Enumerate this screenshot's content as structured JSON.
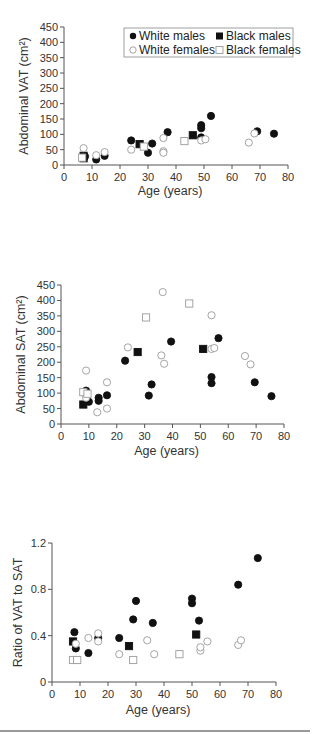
{
  "legend": {
    "white_males": "White males",
    "black_males": "Black males",
    "white_females": "White females",
    "black_females": "Black females"
  },
  "colors": {
    "filled": "#111111",
    "open_stroke": "#9a9a9a",
    "axis": "#555555"
  },
  "chart_data": [
    {
      "type": "scatter",
      "title": "",
      "xlabel": "Age (years)",
      "ylabel": "Abdominal VAT (cm²)",
      "xlim": [
        0,
        80
      ],
      "ylim": [
        0,
        450
      ],
      "xticks": [
        0,
        10,
        20,
        30,
        40,
        50,
        60,
        70,
        80
      ],
      "yticks": [
        0,
        50,
        100,
        150,
        200,
        250,
        300,
        350,
        400,
        450
      ],
      "grid": false,
      "legend_position": "upper right",
      "series": [
        {
          "name": "White males",
          "marker": "filled-circle",
          "points": [
            [
              7.5,
              28
            ],
            [
              11.5,
              18
            ],
            [
              14.5,
              30
            ],
            [
              24,
              80
            ],
            [
              30,
              40
            ],
            [
              31.5,
              70
            ],
            [
              37,
              107
            ],
            [
              49,
              90
            ],
            [
              49,
              120
            ],
            [
              49,
              130
            ],
            [
              52.5,
              160
            ],
            [
              69,
              110
            ],
            [
              75,
              102
            ]
          ]
        },
        {
          "name": "Black males",
          "marker": "filled-square",
          "points": [
            [
              7,
              22
            ],
            [
              7,
              30
            ],
            [
              27,
              68
            ],
            [
              46,
              97
            ]
          ]
        },
        {
          "name": "White females",
          "marker": "open-circle",
          "points": [
            [
              7,
              55
            ],
            [
              11.5,
              32
            ],
            [
              14.5,
              42
            ],
            [
              24,
              50
            ],
            [
              35.5,
              88
            ],
            [
              35.5,
              45
            ],
            [
              35.5,
              40
            ],
            [
              49,
              80
            ],
            [
              50.5,
              84
            ],
            [
              66,
              73
            ],
            [
              68,
              103
            ]
          ]
        },
        {
          "name": "Black females",
          "marker": "open-square",
          "points": [
            [
              6.5,
              24
            ],
            [
              28.5,
              60
            ],
            [
              43,
              78
            ]
          ]
        }
      ]
    },
    {
      "type": "scatter",
      "title": "",
      "xlabel": "Age (years)",
      "ylabel": "Abdominal SAT (cm²)",
      "xlim": [
        0,
        80
      ],
      "ylim": [
        0,
        450
      ],
      "xticks": [
        0,
        10,
        20,
        30,
        40,
        50,
        60,
        70,
        80
      ],
      "yticks": [
        0,
        50,
        100,
        150,
        200,
        250,
        300,
        350,
        400,
        450
      ],
      "grid": false,
      "series": [
        {
          "name": "White males",
          "marker": "filled-circle",
          "points": [
            [
              9,
              108
            ],
            [
              10,
              72
            ],
            [
              13.5,
              85
            ],
            [
              13.5,
              75
            ],
            [
              16.5,
              93
            ],
            [
              23,
              205
            ],
            [
              31.5,
              92
            ],
            [
              32.5,
              128
            ],
            [
              39.5,
              267
            ],
            [
              54,
              152
            ],
            [
              54,
              132
            ],
            [
              56.5,
              278
            ],
            [
              69.5,
              135
            ],
            [
              75.5,
              90
            ]
          ]
        },
        {
          "name": "Black males",
          "marker": "filled-square",
          "points": [
            [
              8,
              63
            ],
            [
              27.5,
              233
            ],
            [
              51,
              243
            ]
          ]
        },
        {
          "name": "White females",
          "marker": "open-circle",
          "points": [
            [
              9,
              173
            ],
            [
              9,
              85
            ],
            [
              13,
              38
            ],
            [
              16.5,
              135
            ],
            [
              16.5,
              50
            ],
            [
              24,
              248
            ],
            [
              36,
              222
            ],
            [
              37,
              195
            ],
            [
              36.5,
              427
            ],
            [
              54,
              352
            ],
            [
              54,
              243
            ],
            [
              55,
              246
            ],
            [
              66,
              220
            ],
            [
              68,
              193
            ]
          ]
        },
        {
          "name": "Black females",
          "marker": "open-square",
          "points": [
            [
              8,
              103
            ],
            [
              9.5,
              98
            ],
            [
              30.5,
              345
            ],
            [
              46,
              390
            ]
          ]
        }
      ]
    },
    {
      "type": "scatter",
      "title": "",
      "xlabel": "Age (years)",
      "ylabel": "Ratio of VAT to SAT",
      "xlim": [
        0,
        80
      ],
      "ylim": [
        0,
        1.2
      ],
      "xticks": [
        0,
        10,
        20,
        30,
        40,
        50,
        60,
        70,
        80
      ],
      "yticks": [
        0,
        0.4,
        0.8,
        1.2
      ],
      "grid": false,
      "series": [
        {
          "name": "White males",
          "marker": "filled-circle",
          "points": [
            [
              8,
              0.43
            ],
            [
              8.5,
              0.29
            ],
            [
              13,
              0.25
            ],
            [
              16.5,
              0.38
            ],
            [
              24,
              0.38
            ],
            [
              29,
              0.54
            ],
            [
              30,
              0.7
            ],
            [
              36,
              0.51
            ],
            [
              50,
              0.72
            ],
            [
              50,
              0.68
            ],
            [
              52.5,
              0.53
            ],
            [
              66.5,
              0.84
            ],
            [
              73.5,
              1.07
            ]
          ]
        },
        {
          "name": "Black males",
          "marker": "filled-square",
          "points": [
            [
              7.5,
              0.35
            ],
            [
              27.5,
              0.31
            ],
            [
              51.5,
              0.41
            ]
          ]
        },
        {
          "name": "White females",
          "marker": "open-circle",
          "points": [
            [
              8.5,
              0.33
            ],
            [
              13,
              0.38
            ],
            [
              16.5,
              0.42
            ],
            [
              16.5,
              0.35
            ],
            [
              24,
              0.24
            ],
            [
              34,
              0.36
            ],
            [
              36.5,
              0.24
            ],
            [
              53,
              0.27
            ],
            [
              53,
              0.3
            ],
            [
              55.5,
              0.35
            ],
            [
              66.5,
              0.32
            ],
            [
              67.5,
              0.36
            ]
          ]
        },
        {
          "name": "Black females",
          "marker": "open-square",
          "points": [
            [
              7.5,
              0.19
            ],
            [
              9,
              0.19
            ],
            [
              29,
              0.19
            ],
            [
              45.5,
              0.24
            ]
          ]
        }
      ]
    }
  ]
}
